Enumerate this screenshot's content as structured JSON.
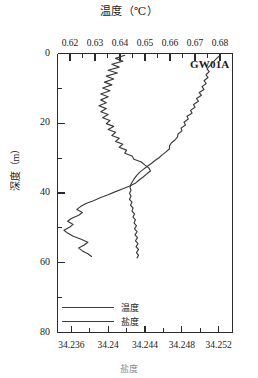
{
  "chart_data": {
    "type": "line",
    "title": "温度（℃）",
    "xlabel": "温度（℃）",
    "xlabel_bottom": "盐度",
    "ylabel": "深度（m）",
    "station": "GW01A",
    "orientation": "vertical-profile",
    "grid": false,
    "legend_position": "bottom-left",
    "top_axis": {
      "label": "温度（℃）",
      "ticks": [
        "0.62",
        "0.63",
        "0.64",
        "0.65",
        "0.66",
        "0.67",
        "0.68"
      ],
      "values": [
        0.62,
        0.63,
        0.64,
        0.65,
        0.66,
        0.67,
        0.68
      ],
      "range": [
        0.615,
        0.685
      ],
      "minor_ticks_per_interval": 1
    },
    "bottom_axis": {
      "label": "盐度",
      "ticks": [
        "34.236",
        "34.24",
        "34.244",
        "34.248",
        "34.252"
      ],
      "values": [
        34.236,
        34.24,
        34.244,
        34.248,
        34.252
      ],
      "range": [
        34.2345,
        34.2535
      ],
      "minor_ticks_per_interval": 1
    },
    "y_axis": {
      "label": "深度（m）",
      "ticks": [
        "0",
        "20",
        "40",
        "60",
        "80"
      ],
      "values": [
        0,
        20,
        40,
        60,
        80
      ],
      "range": [
        0,
        80
      ],
      "direction": "inverted",
      "minor_ticks_per_interval": 1
    },
    "series": [
      {
        "name": "温度",
        "axis": "top",
        "unit": "℃",
        "color": "#3a3a3a",
        "points": [
          [
            0.68,
            0.5
          ],
          [
            0.6784,
            1.6
          ],
          [
            0.677,
            2.6
          ],
          [
            0.6758,
            3.6
          ],
          [
            0.6748,
            4.4
          ],
          [
            0.6757,
            5.2
          ],
          [
            0.6744,
            6.1
          ],
          [
            0.6752,
            6.9
          ],
          [
            0.6736,
            7.8
          ],
          [
            0.6745,
            8.6
          ],
          [
            0.6728,
            9.5
          ],
          [
            0.6736,
            10.3
          ],
          [
            0.6717,
            11.2
          ],
          [
            0.6726,
            12.0
          ],
          [
            0.6706,
            12.9
          ],
          [
            0.6714,
            13.7
          ],
          [
            0.6694,
            14.6
          ],
          [
            0.67,
            15.4
          ],
          [
            0.6682,
            16.3
          ],
          [
            0.6688,
            17.1
          ],
          [
            0.6668,
            18.0
          ],
          [
            0.6673,
            18.8
          ],
          [
            0.6656,
            19.7
          ],
          [
            0.6662,
            20.5
          ],
          [
            0.6644,
            21.4
          ],
          [
            0.6648,
            22.2
          ],
          [
            0.6632,
            23.1
          ],
          [
            0.663,
            23.9
          ],
          [
            0.662,
            24.8
          ],
          [
            0.6606,
            25.6
          ],
          [
            0.6598,
            26.5
          ],
          [
            0.6598,
            27.3
          ],
          [
            0.6584,
            28.2
          ],
          [
            0.657,
            29.0
          ],
          [
            0.6556,
            29.9
          ],
          [
            0.654,
            30.7
          ],
          [
            0.6524,
            31.6
          ],
          [
            0.6508,
            32.4
          ],
          [
            0.6492,
            33.3
          ],
          [
            0.6478,
            34.1
          ],
          [
            0.6466,
            35.0
          ],
          [
            0.6458,
            35.8
          ],
          [
            0.645,
            36.7
          ],
          [
            0.6444,
            37.5
          ],
          [
            0.644,
            38.4
          ],
          [
            0.6444,
            39.2
          ],
          [
            0.6438,
            40.1
          ],
          [
            0.6444,
            40.9
          ],
          [
            0.6438,
            41.8
          ],
          [
            0.6448,
            42.6
          ],
          [
            0.6442,
            43.5
          ],
          [
            0.6452,
            44.3
          ],
          [
            0.6448,
            45.2
          ],
          [
            0.6458,
            46.0
          ],
          [
            0.6452,
            46.9
          ],
          [
            0.6462,
            47.7
          ],
          [
            0.6456,
            48.6
          ],
          [
            0.6466,
            49.4
          ],
          [
            0.6458,
            50.3
          ],
          [
            0.6468,
            51.1
          ],
          [
            0.646,
            52.0
          ],
          [
            0.647,
            52.8
          ],
          [
            0.6462,
            53.7
          ],
          [
            0.6472,
            54.5
          ],
          [
            0.6464,
            55.4
          ],
          [
            0.6474,
            56.2
          ],
          [
            0.6466,
            57.1
          ],
          [
            0.6474,
            57.9
          ],
          [
            0.6468,
            58.6
          ]
        ]
      },
      {
        "name": "盐度",
        "axis": "bottom",
        "unit": "",
        "color": "#3a3a3a",
        "points": [
          [
            34.2418,
            0.5
          ],
          [
            34.2408,
            1.4
          ],
          [
            34.2416,
            2.2
          ],
          [
            34.2404,
            3.1
          ],
          [
            34.2412,
            3.9
          ],
          [
            34.24,
            4.8
          ],
          [
            34.241,
            5.6
          ],
          [
            34.2398,
            6.5
          ],
          [
            34.2406,
            7.3
          ],
          [
            34.2396,
            8.2
          ],
          [
            34.2404,
            9.0
          ],
          [
            34.2394,
            9.9
          ],
          [
            34.2402,
            10.7
          ],
          [
            34.2392,
            11.6
          ],
          [
            34.24,
            12.4
          ],
          [
            34.2392,
            13.3
          ],
          [
            34.2398,
            14.1
          ],
          [
            34.239,
            15.0
          ],
          [
            34.2398,
            15.8
          ],
          [
            34.2392,
            16.7
          ],
          [
            34.24,
            17.5
          ],
          [
            34.2394,
            18.4
          ],
          [
            34.2402,
            19.2
          ],
          [
            34.2398,
            20.1
          ],
          [
            34.2406,
            20.9
          ],
          [
            34.24,
            21.8
          ],
          [
            34.2408,
            22.6
          ],
          [
            34.2404,
            23.5
          ],
          [
            34.2412,
            24.3
          ],
          [
            34.2408,
            25.2
          ],
          [
            34.2416,
            26.0
          ],
          [
            34.2412,
            26.9
          ],
          [
            34.242,
            27.7
          ],
          [
            34.2418,
            28.6
          ],
          [
            34.2426,
            29.4
          ],
          [
            34.2428,
            30.3
          ],
          [
            34.2436,
            31.1
          ],
          [
            34.244,
            32.0
          ],
          [
            34.2444,
            32.8
          ],
          [
            34.2446,
            33.7
          ],
          [
            34.2442,
            34.5
          ],
          [
            34.2438,
            35.4
          ],
          [
            34.2434,
            36.2
          ],
          [
            34.243,
            37.1
          ],
          [
            34.2424,
            37.9
          ],
          [
            34.2416,
            38.8
          ],
          [
            34.2408,
            39.6
          ],
          [
            34.24,
            40.5
          ],
          [
            34.2392,
            41.3
          ],
          [
            34.2384,
            42.2
          ],
          [
            34.2376,
            43.0
          ],
          [
            34.237,
            43.9
          ],
          [
            34.2366,
            44.7
          ],
          [
            34.2372,
            45.6
          ],
          [
            34.2368,
            46.4
          ],
          [
            34.236,
            47.3
          ],
          [
            34.2356,
            48.1
          ],
          [
            34.2362,
            49.0
          ],
          [
            34.2358,
            49.8
          ],
          [
            34.2352,
            50.7
          ],
          [
            34.2356,
            51.5
          ],
          [
            34.2362,
            52.4
          ],
          [
            34.237,
            53.2
          ],
          [
            34.2378,
            54.1
          ],
          [
            34.2374,
            54.9
          ],
          [
            34.2368,
            55.8
          ],
          [
            34.2372,
            56.6
          ],
          [
            34.2378,
            57.4
          ],
          [
            34.2382,
            58.2
          ]
        ]
      }
    ],
    "legend": [
      {
        "label": "温度"
      },
      {
        "label": "盐度"
      }
    ],
    "annotations": [
      {
        "text": "GW01A",
        "x": 0.6755,
        "y": 2.0
      }
    ]
  }
}
